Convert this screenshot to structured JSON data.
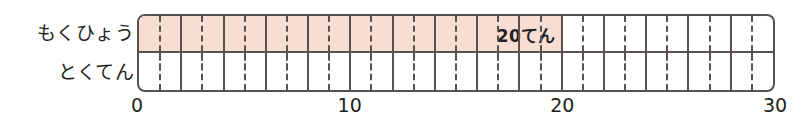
{
  "rows": [
    {
      "id": "goal",
      "label": "もくひょう"
    },
    {
      "id": "score",
      "label": "とくてん"
    }
  ],
  "chart_data": {
    "type": "bar",
    "orientation": "horizontal",
    "title": "",
    "xlabel": "",
    "ylabel": "",
    "categories": [
      "もくひょう",
      "とくてん"
    ],
    "values": [
      20,
      0
    ],
    "data_labels": [
      "20てん",
      ""
    ],
    "xlim": [
      0,
      30
    ],
    "xticks": [
      0,
      10,
      20,
      30
    ],
    "xtick_labels": [
      "0",
      "10",
      "20",
      "30"
    ],
    "minor_tick_step": 1,
    "major_tick_step": 2,
    "grid": true,
    "legend": false,
    "bar_color": "#f8ddd3",
    "line_color": "#58524f",
    "background": "#ffffff"
  },
  "axis": {
    "labels": [
      {
        "value": 0,
        "text": "0"
      },
      {
        "value": 10,
        "text": "10"
      },
      {
        "value": 20,
        "text": "20"
      },
      {
        "value": 30,
        "text": "30"
      }
    ]
  }
}
